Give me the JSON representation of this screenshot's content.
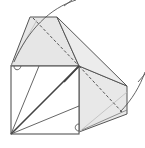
{
  "diagram": {
    "title": "",
    "colors": {
      "background": "#ffffff",
      "line": "#555555",
      "shade": "#e4e4e4",
      "shade_light": "#ececec"
    }
  }
}
